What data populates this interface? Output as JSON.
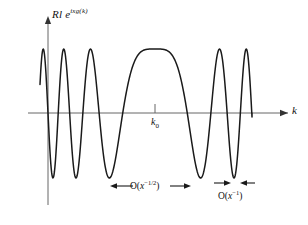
{
  "figure": {
    "kind": "math-plot",
    "background": "#ffffff",
    "stroke_color": "#1a1a1a",
    "axis_color": "#555555",
    "y_axis_label": "Rl e",
    "y_axis_label_exponent": "ixg(k)",
    "x_axis_label": "k",
    "stationary_point_label": "k",
    "stationary_point_subscript": "0",
    "annotations": {
      "central_width": {
        "prefix": "O(",
        "variable": "x",
        "exponent": "−1/2",
        "suffix": ")",
        "arrow_style": "outward"
      },
      "oscillation_period": {
        "prefix": "O(",
        "variable": "x",
        "exponent": "−1",
        "suffix": ")",
        "arrow_style": "inward"
      }
    }
  },
  "chart_data": {
    "type": "line",
    "title": "",
    "xlabel": "k",
    "ylabel": "Rl e^{ixg(k)}",
    "grid": false,
    "legend": null,
    "xlim": [
      0,
      308
    ],
    "ylim": [
      -1.05,
      1.05
    ],
    "axis_y_pixel": 113,
    "y_axis_x_pixel": 48,
    "amplitude_peak_pixel": 49,
    "amplitude_trough_pixel": 178,
    "stationary_point_x_pixel": 155,
    "series": [
      {
        "name": "Rl e^{ixg(k)}",
        "comment": "cos(x*g(k)) with g quadratic about k0; sampled as phase-vs-pixel control data",
        "wave_start_x_pixel": 40,
        "wave_end_x_pixel": 252,
        "zero_crossings_pixel": [
          44,
          52,
          62,
          70,
          80,
          88,
          98,
          106,
          117,
          127,
          183,
          193,
          203,
          211,
          221,
          229,
          239,
          247
        ],
        "peaks_pixel": [
          {
            "x": 57,
            "y": 1
          },
          {
            "x": 75,
            "y": 1
          },
          {
            "x": 93,
            "y": 1
          },
          {
            "x": 155,
            "y": 1
          },
          {
            "x": 198,
            "y": 1
          },
          {
            "x": 216,
            "y": 1
          },
          {
            "x": 234,
            "y": 1
          }
        ],
        "troughs_pixel": [
          {
            "x": 48,
            "y": -1
          },
          {
            "x": 66,
            "y": -1
          },
          {
            "x": 84,
            "y": -1
          },
          {
            "x": 111,
            "y": -1
          },
          {
            "x": 188,
            "y": -1
          },
          {
            "x": 207,
            "y": -1
          },
          {
            "x": 225,
            "y": -1
          },
          {
            "x": 243,
            "y": -1
          }
        ]
      }
    ],
    "annotation_spans_pixel": {
      "central_width": {
        "x1": 113,
        "x2": 188,
        "y": 186
      },
      "oscillation_period": {
        "x1": 217,
        "x2": 252,
        "y": 186
      }
    }
  }
}
